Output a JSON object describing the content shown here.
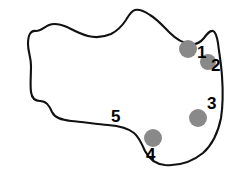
{
  "figure": {
    "kind": "annotated-region-outline",
    "background_color": "#ffffff",
    "outline": {
      "name": "region-outline",
      "stroke_color": "#111111",
      "stroke_width": 2.1,
      "fill_color": "#ffffff",
      "description": "hand-drawn irregular closed contour resembling a blob or anatomical region"
    },
    "markers": {
      "fill_color": "#898989",
      "shape": "circle",
      "items": [
        {
          "id": "marker-1",
          "label": "1",
          "cx": 188,
          "cy": 49,
          "r": 9
        },
        {
          "id": "marker-2",
          "label": "2",
          "cx": 208,
          "cy": 62,
          "r": 8
        },
        {
          "id": "marker-3",
          "label": "3",
          "cx": 198,
          "cy": 118,
          "r": 9
        },
        {
          "id": "marker-4",
          "label": "4",
          "cx": 153,
          "cy": 138,
          "r": 9
        }
      ]
    },
    "labels": [
      {
        "id": "label-1",
        "text": "1",
        "x": 197,
        "y": 44,
        "font_size": 17,
        "color": "#000000"
      },
      {
        "id": "label-2",
        "text": "2",
        "x": 211,
        "y": 57,
        "font_size": 17,
        "color": "#000000"
      },
      {
        "id": "label-3",
        "text": "3",
        "x": 207,
        "y": 95,
        "font_size": 17,
        "color": "#000000"
      },
      {
        "id": "label-4",
        "text": "4",
        "x": 146,
        "y": 146,
        "font_size": 17,
        "color": "#000000"
      },
      {
        "id": "label-5",
        "text": "5",
        "x": 111,
        "y": 108,
        "font_size": 17,
        "color": "#000000"
      }
    ],
    "outline_path": "M 36 31 C 30 30 28 36 28 44 C 28 52 31 57 31 66 C 31 76 30 84 31 92 C 32 99 36 101 40 101 C 46 101 49 105 52 112 C 55 118 61 120 71 121 C 83 122 96 124 108 125 C 120 126 128 128 134 133 C 139 137 142 144 145 151 C 149 159 155 164 165 165 C 178 166 192 162 203 153 C 212 145 218 133 221 118 C 223 105 223 90 222 76 C 221 62 219 52 218 43 C 217 37 216 32 213 31 C 210 30 207 34 204 38 C 200 43 196 45 190 44 C 183 43 176 39 170 33 C 163 26 157 19 150 15 C 144 11 139 9 135 10 C 131 11 129 15 126 20 C 122 26 117 31 111 34 C 104 37 96 38 88 36 C 80 34 73 30 67 27 C 60 24 54 23 49 25 C 44 27 41 31 36 31 Z",
    "label5_tick": {
      "from_x": 116,
      "from_y": 119,
      "to_x": 121,
      "to_y": 126
    }
  }
}
